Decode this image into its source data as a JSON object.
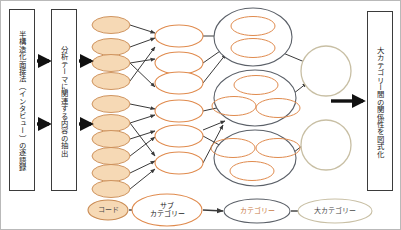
{
  "diagram": {
    "background_color": "#ffffff",
    "border_color": "#b9b9b9"
  },
  "colors": {
    "code_fill": "#f6d9b5",
    "code_stroke": "#c98a52",
    "subcategory_fill": "#ffffff",
    "subcategory_stroke": "#e08b4e",
    "category_stroke": "#5b6068",
    "category_inner_stroke": "#e08b4e",
    "bigcategory_stroke": "#c8bfa4",
    "arrow_color": "#3a3a3a",
    "box_stroke": "#3b3b3b",
    "text_color": "#1b1b1b"
  },
  "boxes": [
    {
      "id": "transcript-box",
      "name": "transcript-box",
      "text": "半構造化面接法（インタビュー）の逐語録",
      "x": 8,
      "y": 8,
      "w": 26,
      "h": 182
    },
    {
      "id": "extraction-box",
      "name": "extraction-box",
      "text": "分析テーマに関連する内容の抽出",
      "x": 50,
      "y": 8,
      "w": 26,
      "h": 182
    },
    {
      "id": "relation-diagram-box",
      "name": "relation-diagram-box",
      "text": "大カテゴリー間の関係性を図式化",
      "x": 366,
      "y": 10,
      "w": 26,
      "h": 180
    }
  ],
  "main_arrows": [
    {
      "name": "arrow-transcript-to-extraction-upper",
      "x1": 36,
      "y1": 60,
      "x2": 48,
      "y2": 60
    },
    {
      "name": "arrow-transcript-to-extraction-lower",
      "x1": 36,
      "y1": 123,
      "x2": 48,
      "y2": 123
    },
    {
      "name": "arrow-extraction-to-codes-upper",
      "x1": 78,
      "y1": 60,
      "x2": 90,
      "y2": 60
    },
    {
      "name": "arrow-extraction-to-codes-lower",
      "x1": 78,
      "y1": 123,
      "x2": 90,
      "y2": 123
    },
    {
      "name": "arrow-bigcategories-to-relation",
      "x1": 330,
      "y1": 100,
      "x2": 362,
      "y2": 100
    }
  ],
  "codes": [
    {
      "name": "code-node-1",
      "cx": 110,
      "cy": 24,
      "rx": 19,
      "ry": 8.5
    },
    {
      "name": "code-node-2",
      "cx": 110,
      "cy": 46,
      "rx": 19,
      "ry": 8.5
    },
    {
      "name": "code-node-3",
      "cx": 110,
      "cy": 62,
      "rx": 19,
      "ry": 8.5
    },
    {
      "name": "code-node-4",
      "cx": 110,
      "cy": 80,
      "rx": 19,
      "ry": 8.5
    },
    {
      "name": "code-node-5",
      "cx": 110,
      "cy": 103,
      "rx": 19,
      "ry": 8.5
    },
    {
      "name": "code-node-6",
      "cx": 110,
      "cy": 122,
      "rx": 19,
      "ry": 8.5
    },
    {
      "name": "code-node-7",
      "cx": 110,
      "cy": 138,
      "rx": 19,
      "ry": 8.5
    },
    {
      "name": "code-node-8",
      "cx": 110,
      "cy": 155,
      "rx": 19,
      "ry": 8.5
    },
    {
      "name": "code-node-9",
      "cx": 110,
      "cy": 172,
      "rx": 19,
      "ry": 8.5
    },
    {
      "name": "code-node-10",
      "cx": 110,
      "cy": 188,
      "rx": 19,
      "ry": 8.5
    }
  ],
  "subcategories": [
    {
      "name": "subcategory-node-1",
      "cx": 178,
      "cy": 35,
      "rx": 24,
      "ry": 11
    },
    {
      "name": "subcategory-node-2",
      "cx": 178,
      "cy": 62,
      "rx": 24,
      "ry": 11
    },
    {
      "name": "subcategory-node-3",
      "cx": 178,
      "cy": 82,
      "rx": 24,
      "ry": 11
    },
    {
      "name": "subcategory-node-4",
      "cx": 178,
      "cy": 110,
      "rx": 24,
      "ry": 11
    },
    {
      "name": "subcategory-node-5",
      "cx": 178,
      "cy": 135,
      "rx": 24,
      "ry": 11
    },
    {
      "name": "subcategory-node-6",
      "cx": 178,
      "cy": 162,
      "rx": 24,
      "ry": 11
    }
  ],
  "categories": [
    {
      "name": "category-group-1",
      "cx": 252,
      "cy": 36,
      "rx": 39,
      "ry": 29,
      "members": [
        {
          "name": "category-member-1-1",
          "cx": 252,
          "cy": 25,
          "rx": 22,
          "ry": 9.5
        },
        {
          "name": "category-member-1-2",
          "cx": 252,
          "cy": 47,
          "rx": 22,
          "ry": 9.5
        }
      ]
    },
    {
      "name": "category-group-2",
      "cx": 254,
      "cy": 97,
      "rx": 41,
      "ry": 28,
      "members": [
        {
          "name": "category-member-2-1",
          "cx": 255,
          "cy": 84,
          "rx": 22,
          "ry": 9.5
        },
        {
          "name": "category-member-2-2",
          "cx": 233,
          "cy": 105,
          "rx": 22,
          "ry": 9.5
        },
        {
          "name": "category-member-2-3",
          "cx": 277,
          "cy": 107,
          "rx": 22,
          "ry": 9.5
        }
      ]
    },
    {
      "name": "category-group-3",
      "cx": 254,
      "cy": 157,
      "rx": 41,
      "ry": 28,
      "members": [
        {
          "name": "category-member-3-1",
          "cx": 232,
          "cy": 147,
          "rx": 22,
          "ry": 9.5
        },
        {
          "name": "category-member-3-2",
          "cx": 277,
          "cy": 147,
          "rx": 22,
          "ry": 9.5
        },
        {
          "name": "category-member-3-3",
          "cx": 251,
          "cy": 170,
          "rx": 22,
          "ry": 9.5
        }
      ]
    }
  ],
  "bigcategories": [
    {
      "name": "bigcategory-node-1",
      "cx": 325,
      "cy": 70,
      "r": 25
    },
    {
      "name": "bigcategory-node-2",
      "cx": 325,
      "cy": 144,
      "r": 25
    }
  ],
  "legend": {
    "items": [
      {
        "name": "legend-code",
        "label": "コード",
        "cx": 107,
        "cy": 209,
        "rx": 20,
        "ry": 10,
        "fill": "#f6d9b5",
        "stroke": "#c98a52",
        "text_class": "gray"
      },
      {
        "name": "legend-subcategory",
        "label": "サブ\nカテゴリー",
        "cx": 166,
        "cy": 209,
        "rx": 35,
        "ry": 16,
        "fill": "#ffffff",
        "stroke": "#e08b4e",
        "text_class": ""
      },
      {
        "name": "legend-category",
        "label": "カテゴリー",
        "cx": 256,
        "cy": 210,
        "rx": 33,
        "ry": 12,
        "fill": "#ffffff",
        "stroke": "#5b6068",
        "text_class": "orange"
      },
      {
        "name": "legend-bigcategory",
        "label": "大カテゴリー",
        "cx": 334,
        "cy": 210,
        "rx": 37,
        "ry": 12,
        "fill": "#ffffff",
        "stroke": "#c8bfa4",
        "text_class": "gray"
      }
    ],
    "arrows": [
      {
        "name": "legend-arrow-1",
        "x1": 128,
        "y1": 209,
        "x2": 141,
        "y2": 209
      },
      {
        "name": "legend-arrow-2",
        "x1": 202,
        "y1": 209,
        "x2": 222,
        "y2": 210
      },
      {
        "name": "legend-arrow-3",
        "x1": 290,
        "y1": 210,
        "x2": 305,
        "y2": 210
      }
    ]
  },
  "links_code_to_sub": [
    {
      "name": "link-code1-sub1",
      "x1": 129,
      "y1": 24,
      "x2": 154,
      "y2": 32
    },
    {
      "name": "link-code2-sub1",
      "x1": 129,
      "y1": 46,
      "x2": 154,
      "y2": 37
    },
    {
      "name": "link-code3-sub2",
      "x1": 129,
      "y1": 62,
      "x2": 154,
      "y2": 58
    },
    {
      "name": "link-code4-sub3",
      "x1": 129,
      "y1": 80,
      "x2": 154,
      "y2": 46
    },
    {
      "name": "link-code5-sub4",
      "x1": 129,
      "y1": 103,
      "x2": 154,
      "y2": 108
    },
    {
      "name": "link-code6-sub4",
      "x1": 129,
      "y1": 122,
      "x2": 154,
      "y2": 114
    },
    {
      "name": "link-code7-sub5",
      "x1": 129,
      "y1": 138,
      "x2": 154,
      "y2": 130
    },
    {
      "name": "link-code8-sub5",
      "x1": 129,
      "y1": 155,
      "x2": 154,
      "y2": 136
    },
    {
      "name": "link-code9-sub6",
      "x1": 129,
      "y1": 172,
      "x2": 154,
      "y2": 160
    },
    {
      "name": "link-code10-sub6",
      "x1": 129,
      "y1": 188,
      "x2": 154,
      "y2": 168
    },
    {
      "name": "link-code3-sub3",
      "x1": 129,
      "y1": 62,
      "x2": 154,
      "y2": 86
    },
    {
      "name": "link-code6-sub6",
      "x1": 129,
      "y1": 122,
      "x2": 154,
      "y2": 155
    }
  ],
  "links_sub_to_cat": [
    {
      "name": "link-sub1-cat1",
      "x1": 202,
      "y1": 35,
      "x2": 221,
      "y2": 35
    },
    {
      "name": "link-sub2-cat1",
      "x1": 202,
      "y1": 62,
      "x2": 222,
      "y2": 48
    },
    {
      "name": "link-sub3-cat1",
      "x1": 202,
      "y1": 82,
      "x2": 225,
      "y2": 53
    },
    {
      "name": "link-sub4-cat2",
      "x1": 202,
      "y1": 110,
      "x2": 220,
      "y2": 106
    },
    {
      "name": "link-sub5-cat3",
      "x1": 202,
      "y1": 135,
      "x2": 222,
      "y2": 146
    },
    {
      "name": "link-sub6-cat2",
      "x1": 202,
      "y1": 162,
      "x2": 222,
      "y2": 124
    },
    {
      "name": "link-sub5-cat2",
      "x1": 202,
      "y1": 129,
      "x2": 224,
      "y2": 120
    }
  ],
  "links_cat_to_big": [
    {
      "name": "link-cat1-big1",
      "x1": 282,
      "y1": 52,
      "x2": 306,
      "y2": 62
    },
    {
      "name": "link-cat2-big1",
      "x1": 288,
      "y1": 96,
      "x2": 306,
      "y2": 82
    },
    {
      "name": "link-cat3-big2",
      "x1": 288,
      "y1": 155,
      "x2": 306,
      "y2": 141
    }
  ]
}
